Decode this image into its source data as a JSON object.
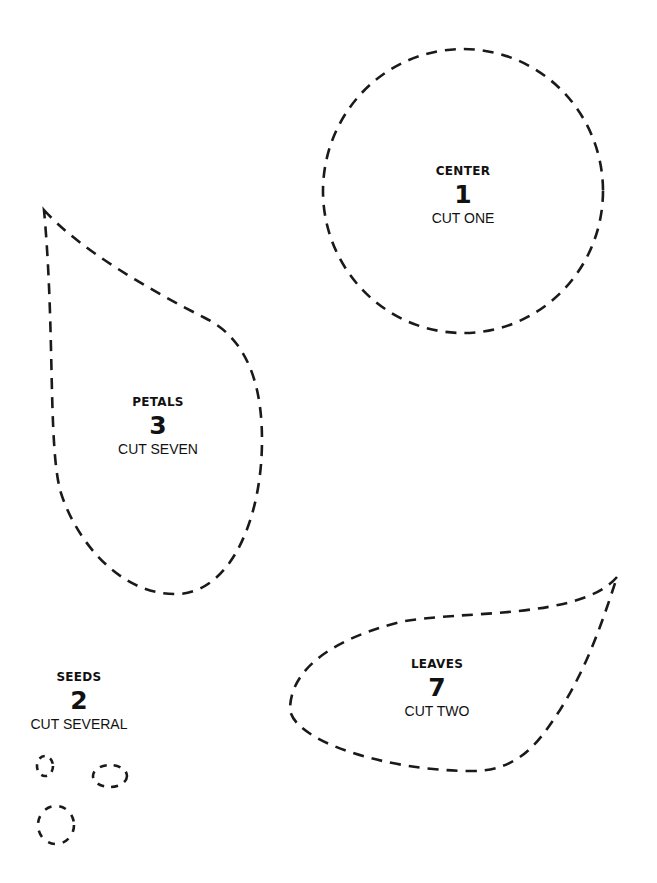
{
  "pieces": [
    {
      "name": "CENTER",
      "number": "1",
      "instruction": "CUT ONE"
    },
    {
      "name": "PETALS",
      "number": "3",
      "instruction": "CUT SEVEN"
    },
    {
      "name": "SEEDS",
      "number": "2",
      "instruction": "CUT SEVERAL"
    },
    {
      "name": "LEAVES",
      "number": "7",
      "instruction": "CUT TWO"
    }
  ],
  "colors": {
    "outline": "#1a1a1a",
    "text": "#111111",
    "background": "#ffffff"
  }
}
